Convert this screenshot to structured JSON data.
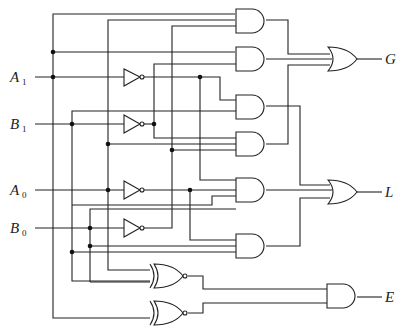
{
  "diagram": {
    "type": "logic-circuit",
    "inputs": [
      {
        "name": "A",
        "sub": "1",
        "y": 77
      },
      {
        "name": "B",
        "sub": "1",
        "y": 124
      },
      {
        "name": "A",
        "sub": "0",
        "y": 190
      },
      {
        "name": "B",
        "sub": "0",
        "y": 228
      }
    ],
    "outputs": [
      {
        "name": "G",
        "y": 59
      },
      {
        "name": "L",
        "y": 192
      },
      {
        "name": "E",
        "y": 297
      }
    ],
    "gates": {
      "inverters": 4,
      "and2": 1,
      "and3": 5,
      "or": 2,
      "xnor": 2
    },
    "colors": {
      "line": "#222222",
      "background": "#ffffff"
    }
  }
}
